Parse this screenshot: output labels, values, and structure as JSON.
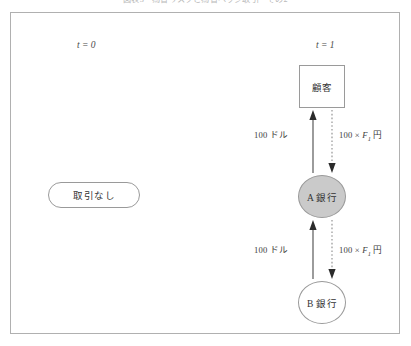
{
  "figure": {
    "caption": "図表3　為替リスクと為替ヘッジ取引　その2"
  },
  "timeline": {
    "t0_label": "t = 0",
    "t1_label": "t = 1"
  },
  "nodes": {
    "no_transaction": "取引なし",
    "customer": "顧客",
    "bank_a": "A 銀行",
    "bank_b": "B 銀行"
  },
  "flows": {
    "upper": {
      "usd_label_prefix": "100 ドル",
      "jpy_amount": "100 ×",
      "jpy_var": "F",
      "jpy_sub": "1",
      "jpy_unit": "円"
    },
    "lower": {
      "usd_label_prefix": "100 ドル",
      "jpy_amount": "100 ×",
      "jpy_var": "F",
      "jpy_sub": "1",
      "jpy_unit": "円"
    }
  },
  "colors": {
    "frame_border": "#b0b0b0",
    "node_border": "#9a9a9a",
    "bank_a_fill": "#cacaca",
    "text": "#333333"
  }
}
